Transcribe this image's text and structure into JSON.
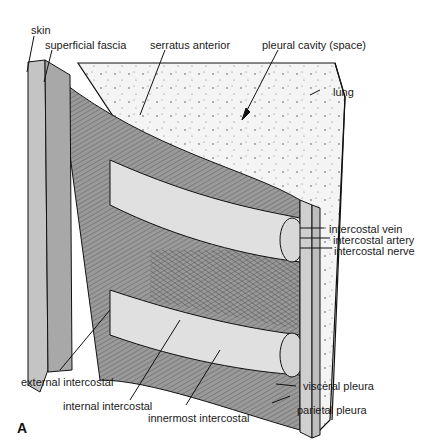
{
  "figure": {
    "panel_letter": "A"
  },
  "labels": {
    "skin": "skin",
    "superficial_fascia": "superficial fascia",
    "serratus_anterior": "serratus anterior",
    "pleural_cavity": "pleural cavity (space)",
    "lung": "lung",
    "intercostal_vein": "intercostal vein",
    "intercostal_artery": "intercostal artery",
    "intercostal_nerve": "intercostal nerve",
    "external_intercostal": "external intercostal",
    "internal_intercostal": "internal intercostal",
    "innermost_intercostal": "innermost intercostal",
    "visceral_pleura": "visceral pleura",
    "parietal_pleura": "parietal pleura"
  },
  "colors": {
    "skin": "#c8c8c8",
    "muscle": "#8a8a8a",
    "rib": "#dcdcdc",
    "lung": "#f4f4f4",
    "line": "#111111"
  }
}
